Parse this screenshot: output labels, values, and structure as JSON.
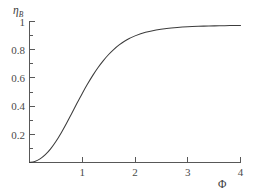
{
  "chart_data": {
    "type": "line",
    "title": "",
    "subtitle": "",
    "xlabel": "Φ",
    "ylabel": "η",
    "ylabel_subscript": "B",
    "xlim": [
      0,
      4.15
    ],
    "ylim": [
      0,
      1.04
    ],
    "grid": false,
    "legend": null,
    "legend_position": "none",
    "background_color": "#ffffff",
    "line_color": "#3c3c3c",
    "axis_color": "#585858",
    "text_color": "#4a4a4a",
    "xticks": [
      1,
      2,
      3,
      4
    ],
    "xtick_labels": [
      "1",
      "2",
      "3",
      "4"
    ],
    "xticks_minor": [],
    "yticks": [
      0.2,
      0.4,
      0.6,
      0.8,
      1
    ],
    "ytick_labels": [
      "0.2",
      "0.4",
      "0.6",
      "0.8",
      "1"
    ],
    "series": [
      {
        "name": "effectiveness",
        "x": [
          0,
          0.1,
          0.2,
          0.3,
          0.4,
          0.5,
          0.6,
          0.7,
          0.8,
          0.9,
          1.0,
          1.1,
          1.2,
          1.3,
          1.4,
          1.5,
          1.6,
          1.7,
          1.8,
          1.9,
          2.0,
          2.2,
          2.4,
          2.6,
          2.8,
          3.0,
          3.2,
          3.4,
          3.6,
          3.8,
          4.0
        ],
        "y": [
          0.0,
          0.007,
          0.026,
          0.056,
          0.097,
          0.149,
          0.21,
          0.277,
          0.348,
          0.42,
          0.49,
          0.556,
          0.618,
          0.674,
          0.723,
          0.766,
          0.803,
          0.834,
          0.86,
          0.881,
          0.898,
          0.923,
          0.94,
          0.951,
          0.958,
          0.963,
          0.966,
          0.968,
          0.97,
          0.971,
          0.972
        ]
      }
    ]
  },
  "figure": {
    "caption": "",
    "ylabel_full": "ηB",
    "xlabel_full": "Φ"
  }
}
